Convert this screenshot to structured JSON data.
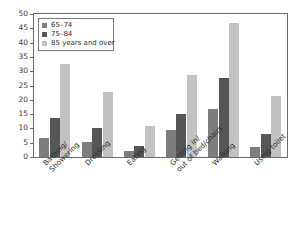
{
  "chart_data": {
    "type": "bar",
    "title": "",
    "subtitle": "",
    "xlabel": "",
    "ylabel": "",
    "ylim": [
      0,
      50
    ],
    "yticks": [
      0,
      5,
      10,
      15,
      20,
      25,
      30,
      35,
      40,
      45,
      50
    ],
    "ytick_labels": [
      "0",
      "5",
      "10",
      "15",
      "20",
      "25",
      "30",
      "35",
      "40",
      "45",
      "50"
    ],
    "grid": false,
    "legend_position": "top-left",
    "categories": [
      "Bathing/ Showering",
      "Dressing",
      "Eating",
      "Getting in/ out of bed/chairs",
      "Walking",
      "Using toilet"
    ],
    "category_lines": [
      [
        "Bathing/",
        "Showering"
      ],
      [
        "Dressing"
      ],
      [
        "Eating"
      ],
      [
        "Getting in/",
        "out of bed/chairs"
      ],
      [
        "Walking"
      ],
      [
        "Using toilet"
      ]
    ],
    "series": [
      {
        "name": "65–74",
        "color": "#7d7d7d",
        "values": [
          6.8,
          5.3,
          2.0,
          9.3,
          16.9,
          3.6
        ]
      },
      {
        "name": "75–84",
        "color": "#565656",
        "values": [
          13.7,
          10.0,
          4.0,
          15.2,
          27.8,
          7.9
        ]
      },
      {
        "name": "85 years and over",
        "color": "#c2c2c2",
        "values": [
          32.6,
          22.7,
          11.0,
          28.7,
          47.0,
          21.2
        ]
      }
    ]
  },
  "legend": {
    "items": [
      {
        "label": "65–74",
        "color": "#7d7d7d"
      },
      {
        "label": "75–84",
        "color": "#565656"
      },
      {
        "label": "85 years and over",
        "color": "#c2c2c2"
      }
    ]
  }
}
